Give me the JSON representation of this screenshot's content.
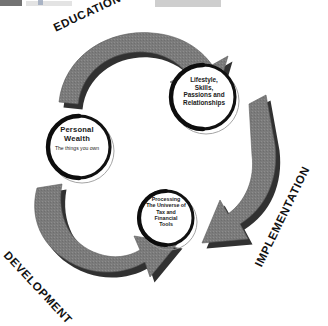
{
  "diagram": {
    "type": "cycle",
    "direction": "clockwise",
    "background_color": "#ffffff",
    "arrow_fill": "#7b7b7b",
    "arrow_shadow": "#1f1f1f",
    "circle_ring_color": "#111111",
    "circle_fill": "#ffffff",
    "text_color": "#1a1a1a",
    "stages": [
      {
        "id": "education",
        "label": "EDUCATION",
        "rotation_deg": -25
      },
      {
        "id": "implementation",
        "label": "IMPLEMENTATION",
        "rotation_deg": -64
      },
      {
        "id": "development",
        "label": "DEVELOPMENT",
        "rotation_deg": 47
      }
    ],
    "nodes": [
      {
        "id": "personal-wealth",
        "title": "Personal",
        "title2": "Wealth",
        "subtitle": "The things you own"
      },
      {
        "id": "lifestyle",
        "line1": "Lifestyle,",
        "line2": "Skills,",
        "line3": "Passions and",
        "line4": "Relationships"
      },
      {
        "id": "processing",
        "line1": "Processing",
        "line2": "The Universe of",
        "line3": "Tax and",
        "line4": "Financial",
        "line5": "Tools"
      }
    ]
  },
  "top_strip": {
    "visible": true
  }
}
